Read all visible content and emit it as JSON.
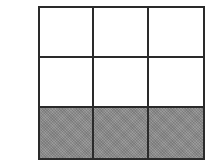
{
  "diagram": {
    "type": "grid",
    "rows": 3,
    "columns": 3,
    "total_cells": 9,
    "shaded_cells": 3,
    "shaded_row": 3,
    "colors": {
      "line": "#2a2a2a",
      "unshaded": "#ffffff",
      "shaded": "#8c8c8c"
    },
    "cells": [
      {
        "row": 1,
        "col": 1,
        "shaded": false
      },
      {
        "row": 1,
        "col": 2,
        "shaded": false
      },
      {
        "row": 1,
        "col": 3,
        "shaded": false
      },
      {
        "row": 2,
        "col": 1,
        "shaded": false
      },
      {
        "row": 2,
        "col": 2,
        "shaded": false
      },
      {
        "row": 2,
        "col": 3,
        "shaded": false
      },
      {
        "row": 3,
        "col": 1,
        "shaded": true
      },
      {
        "row": 3,
        "col": 2,
        "shaded": true
      },
      {
        "row": 3,
        "col": 3,
        "shaded": true
      }
    ]
  }
}
